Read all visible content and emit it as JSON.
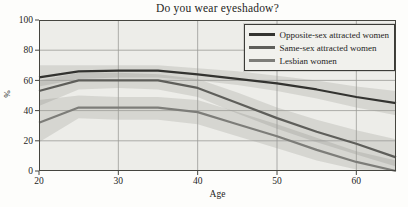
{
  "chart_data": {
    "type": "line",
    "title": "Do you wear eyeshadow?",
    "xlabel": "Age",
    "ylabel": "%",
    "xlim": [
      20,
      65
    ],
    "ylim": [
      0,
      100
    ],
    "x_ticks": [
      20,
      30,
      40,
      50,
      60
    ],
    "y_ticks": [
      0,
      20,
      40,
      60,
      80,
      100
    ],
    "grid": true,
    "legend_position": "upper right",
    "x": [
      20,
      25,
      30,
      35,
      40,
      45,
      50,
      55,
      60,
      65
    ],
    "series": [
      {
        "name": "Opposite-sex attracted women",
        "color": "#333330",
        "values": [
          62,
          66,
          66.5,
          66.5,
          64,
          61,
          58,
          54,
          49,
          45
        ],
        "band_lower": [
          56,
          61,
          62,
          62,
          60,
          57,
          53,
          48,
          42,
          37
        ],
        "band_upper": [
          70,
          70,
          70,
          70,
          68,
          66,
          63,
          60,
          56,
          53
        ]
      },
      {
        "name": "Same-sex attracted women",
        "color": "#5e5e5a",
        "values": [
          53,
          60,
          60,
          60,
          55,
          45,
          35,
          26,
          18,
          9
        ],
        "band_lower": [
          43,
          54,
          55,
          54,
          49,
          38,
          28,
          19,
          11,
          3
        ],
        "band_upper": [
          60,
          65,
          65,
          64,
          61,
          52,
          42,
          34,
          27,
          21
        ]
      },
      {
        "name": "Lesbian women",
        "color": "#7d7d79",
        "values": [
          32,
          42,
          42,
          42,
          39,
          31,
          23,
          14,
          6,
          0
        ],
        "band_lower": [
          19,
          35,
          34,
          34,
          31,
          23,
          15,
          7,
          1,
          0
        ],
        "band_upper": [
          47,
          50,
          49,
          49,
          47,
          39,
          31,
          22,
          13,
          7
        ]
      }
    ],
    "colors": {
      "plot_bg": "#edede9",
      "grid": "#9b9b97",
      "frame": "#45453f",
      "band_fill": "#3c3c38",
      "band_opacity": 0.13,
      "text": "#1d1d1b"
    }
  }
}
